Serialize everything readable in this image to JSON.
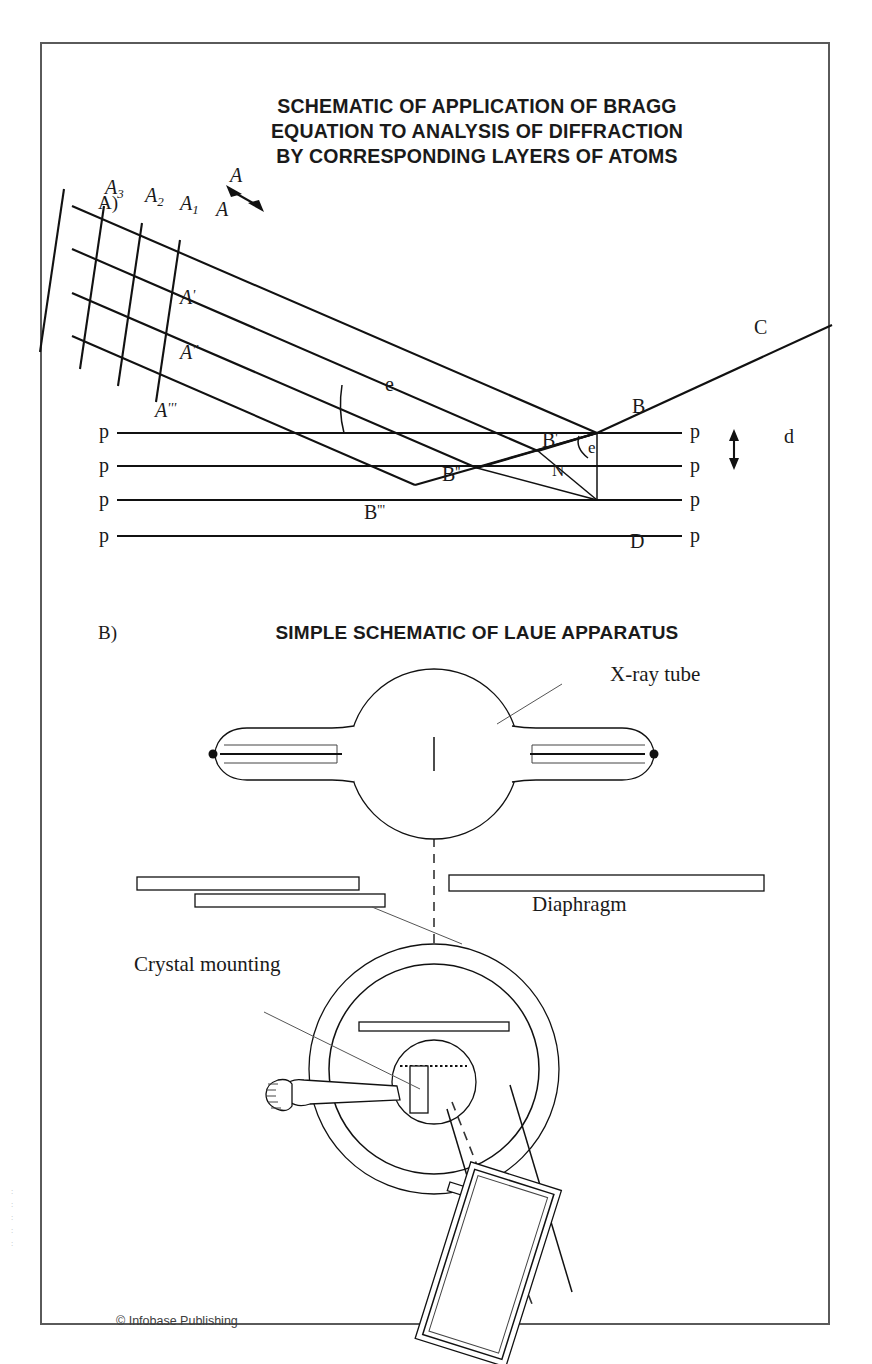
{
  "figure": {
    "panel_a": {
      "letter": "A)",
      "title_lines": [
        "SCHEMATIC OF APPLICATION OF BRAGG",
        "EQUATION TO ANALYSIS OF DIFFRACTION",
        "BY CORRESPONDING LAYERS OF ATOMS"
      ],
      "wavefront_labels": [
        "A",
        "A",
        "A",
        "A"
      ],
      "wavefront_subscripts": [
        "3",
        "2",
        "1",
        ""
      ],
      "ray_labels": [
        "A",
        "A",
        "A"
      ],
      "ray_primes": [
        "'",
        "''",
        "'''"
      ],
      "reflection_points": [
        "B",
        "B",
        "B",
        "B"
      ],
      "reflection_primes": [
        "",
        "'",
        "''",
        "'''"
      ],
      "angle_label_incident": "e",
      "angle_label_at_b": "e",
      "normal_foot_label": "N",
      "drop_point_label": "D",
      "outgoing_beam_label": "C",
      "incident_beam_label": "A",
      "spacing_label": "d",
      "plane_label": "p",
      "plane_labels_left": [
        "p",
        "p",
        "p",
        "p"
      ],
      "plane_labels_right": [
        "p",
        "p",
        "p",
        "p"
      ]
    },
    "panel_b": {
      "letter": "B)",
      "title": "SIMPLE SCHEMATIC OF LAUE APPARATUS",
      "callouts": {
        "xray_tube": "X-ray tube",
        "diaphragm": "Diaphragm",
        "crystal_mounting": "Crystal mounting"
      }
    },
    "credit": "© Infobase Publishing",
    "colors": {
      "ink": "#111111",
      "frame": "#5a5a5a",
      "leader": "#555555",
      "background": "#ffffff"
    }
  }
}
